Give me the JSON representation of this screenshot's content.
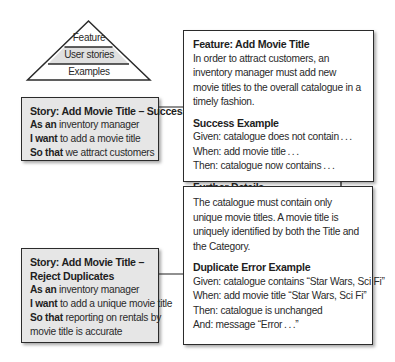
{
  "pyramid": {
    "layers": [
      "Feature",
      "User stories",
      "Examples"
    ],
    "highlight_layer": "User stories",
    "colors": {
      "highlight": "#e0e0e0",
      "outline": "#2b2b2b"
    }
  },
  "stories": [
    {
      "title": "Story: Add Movie Title – Success",
      "as_an_label": "As an",
      "as_an_value": "inventory manager",
      "i_want_label": "I want",
      "i_want_value": "to add a movie title",
      "so_that_label": "So that",
      "so_that_value": "we attract customers"
    },
    {
      "title_line1": "Story: Add Movie Title –",
      "title_line2": "Reject Duplicates",
      "as_an_label": "As an",
      "as_an_value": "inventory manager",
      "i_want_label": "I want",
      "i_want_value": "to add a unique movie title",
      "so_that_label": "So that",
      "so_that_value_line1": "reporting on rentals by",
      "so_that_value_line2": "movie title is accurate"
    }
  ],
  "feature": {
    "title": "Feature: Add Movie Title",
    "description": "In order to attract customers, an inventory manager must add new movie titles to the overall catalogue in a timely fashion.",
    "success_example": {
      "heading": "Success Example",
      "steps": [
        "Given: catalogue does not contain . . .",
        "When: add movie title . . .",
        "Then: catalogue now contains . . ."
      ]
    },
    "further_details": {
      "heading": "Further Details",
      "question": "What if a duplicate movie title is added?"
    }
  },
  "duplicate": {
    "rule": "The catalogue must contain only unique movie titles. A movie title is uniquely identified by both the Title and the Category.",
    "example": {
      "heading": "Duplicate Error Example",
      "steps": [
        "Given: catalogue contains “Star Wars, Sci Fi”",
        "When: add movie title  “Star Wars, Sci Fi”",
        "Then: catalogue is unchanged",
        "And: message “Error . . .”"
      ]
    }
  },
  "colors": {
    "story_fill": "#e6e6e6",
    "box_border": "#2b2b2b",
    "text": "#2a2a2a"
  }
}
